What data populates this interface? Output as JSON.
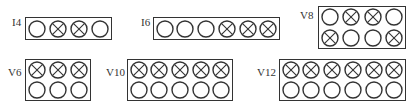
{
  "diagram": {
    "legend_hint": {
      "plain": "cylinder",
      "crossed": "cylinder (crossed)"
    },
    "colors": {
      "stroke": "#333333",
      "background": "#ffffff"
    },
    "engines": [
      {
        "id": "I4",
        "label": "I4",
        "rows": [
          [
            "o",
            "x",
            "x",
            "o"
          ]
        ],
        "label_pos": [
          12,
          16
        ],
        "box": [
          25,
          17,
          87,
          23
        ]
      },
      {
        "id": "I6",
        "label": "I6",
        "rows": [
          [
            "o",
            "o",
            "o",
            "x",
            "x",
            "x"
          ]
        ],
        "label_pos": [
          141,
          16
        ],
        "box": [
          153,
          17,
          127,
          23
        ]
      },
      {
        "id": "V8",
        "label": "V8",
        "rows": [
          [
            "o",
            "x",
            "x",
            "o"
          ],
          [
            "x",
            "o",
            "o",
            "x"
          ]
        ],
        "label_pos": [
          300,
          9
        ],
        "box": [
          318,
          6,
          88,
          43
        ]
      },
      {
        "id": "V6",
        "label": "V6",
        "rows": [
          [
            "x",
            "x",
            "x"
          ],
          [
            "o",
            "o",
            "o"
          ]
        ],
        "label_pos": [
          8,
          66
        ],
        "box": [
          25,
          59,
          66,
          42
        ]
      },
      {
        "id": "V10",
        "label": "V10",
        "rows": [
          [
            "x",
            "x",
            "x",
            "x",
            "x"
          ],
          [
            "o",
            "o",
            "o",
            "o",
            "o"
          ]
        ],
        "label_pos": [
          106,
          66
        ],
        "box": [
          127,
          59,
          106,
          42
        ]
      },
      {
        "id": "V12",
        "label": "V12",
        "rows": [
          [
            "x",
            "x",
            "x",
            "x",
            "x",
            "x"
          ],
          [
            "o",
            "o",
            "o",
            "o",
            "o",
            "o"
          ]
        ],
        "label_pos": [
          257,
          66
        ],
        "box": [
          279,
          59,
          127,
          42
        ]
      }
    ]
  }
}
